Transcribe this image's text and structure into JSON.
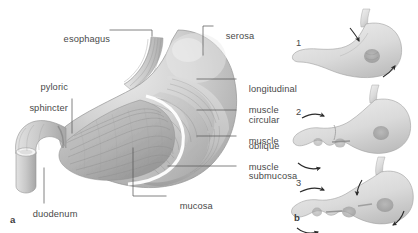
{
  "figure": {
    "type": "anatomical-illustration",
    "style": "grayscale pencil/airbrush medical illustration",
    "background_color": "#ffffff",
    "label_color": "#4a4a4a",
    "leader_color": "#585858"
  },
  "panel_a": {
    "letter": "a",
    "description": "Cut-away view of the stomach showing wall layers",
    "labels": [
      {
        "name": "esophagus",
        "text": "esophagus",
        "line2": "",
        "side": "left"
      },
      {
        "name": "pyloric-sphincter",
        "text": "pyloric",
        "line2": "sphincter",
        "side": "left"
      },
      {
        "name": "duodenum",
        "text": "duodenum",
        "line2": "",
        "side": "left"
      },
      {
        "name": "serosa",
        "text": "serosa",
        "line2": "",
        "side": "right"
      },
      {
        "name": "longitudinal-muscle",
        "text": "longitudinal",
        "line2": "muscle",
        "side": "right"
      },
      {
        "name": "circular-muscle",
        "text": "circular",
        "line2": "muscle",
        "side": "right"
      },
      {
        "name": "oblique-muscle",
        "text": "oblique",
        "line2": "muscle",
        "side": "right"
      },
      {
        "name": "submucosa",
        "text": "submucosa",
        "line2": "",
        "side": "right"
      },
      {
        "name": "mucosa",
        "text": "mucosa",
        "line2": "",
        "side": "right"
      }
    ]
  },
  "panel_b": {
    "letter": "b",
    "description": "Three-stage sequence of gastric peristalsis and mixing waves",
    "steps": [
      {
        "number": "1",
        "name": "peristalsis-stage-1"
      },
      {
        "number": "2",
        "name": "peristalsis-stage-2"
      },
      {
        "number": "3",
        "name": "peristalsis-stage-3"
      }
    ]
  }
}
